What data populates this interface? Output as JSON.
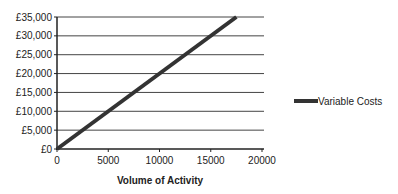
{
  "chart_data": {
    "type": "line",
    "title": "",
    "xlabel": "Volume of Activity",
    "ylabel": "",
    "xlim": [
      0,
      20000
    ],
    "ylim": [
      0,
      35000
    ],
    "x_ticks": [
      "0",
      "5000",
      "10000",
      "15000",
      "20000"
    ],
    "y_ticks": [
      "£0",
      "£5,000",
      "£10,000",
      "£15,000",
      "£20,000",
      "£25,000",
      "£30,000",
      "£35,000"
    ],
    "grid": "horizontal",
    "legend_position": "right",
    "series": [
      {
        "name": "Variable Costs",
        "color": "#333333",
        "x": [
          0,
          17500
        ],
        "y": [
          0,
          35000
        ]
      }
    ]
  },
  "legend": {
    "label": "Variable Costs"
  }
}
